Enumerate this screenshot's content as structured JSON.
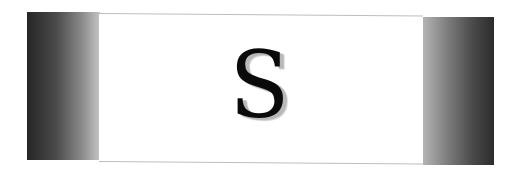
{
  "banner": {
    "letter": "S",
    "colors": {
      "background": "#ffffff",
      "bar_dark": "#262626",
      "bar_light": "#c4c4c4",
      "letter": "#0a0a0a",
      "letter_shadow": "#b8b8b8",
      "panel_border": "#bdbdbd"
    }
  }
}
